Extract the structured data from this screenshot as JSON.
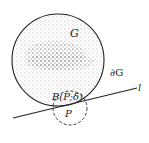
{
  "labels": {
    "region": "G",
    "boundary": "∂G",
    "line": "l",
    "ball": "B(P;δ)",
    "point": "P"
  },
  "colors": {
    "ink": "#222222",
    "background": "#ffffff"
  }
}
